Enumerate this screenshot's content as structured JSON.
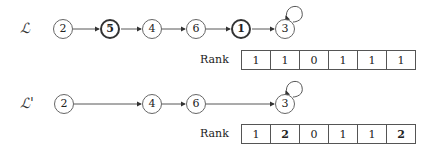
{
  "list_original": {
    "label": "ℒ",
    "nodes": [
      {
        "value": "2",
        "bold": false
      },
      {
        "value": "5",
        "bold": true
      },
      {
        "value": "4",
        "bold": false
      },
      {
        "value": "6",
        "bold": false
      },
      {
        "value": "1",
        "bold": true
      },
      {
        "value": "3",
        "bold": false
      }
    ],
    "self_loop_on": "3",
    "rank_label": "Rank",
    "rank": [
      "1",
      "1",
      "0",
      "1",
      "1",
      "1"
    ]
  },
  "list_reduced": {
    "label": "ℒ'",
    "nodes": [
      {
        "value": "2",
        "bold": false
      },
      {
        "value": "4",
        "bold": false
      },
      {
        "value": "6",
        "bold": false
      },
      {
        "value": "3",
        "bold": false
      }
    ],
    "self_loop_on": "3",
    "rank_label": "Rank",
    "rank": [
      "1",
      "2",
      "0",
      "1",
      "1",
      "2"
    ],
    "rank_bold": [
      false,
      true,
      false,
      false,
      false,
      true
    ]
  }
}
